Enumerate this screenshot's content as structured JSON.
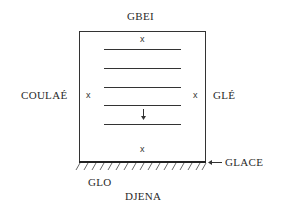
{
  "labels": {
    "top": "GBEI",
    "left": "COULAÉ",
    "right": "GLÉ",
    "ground_arrow": "GLACE",
    "bottom_left": "GLO",
    "bottom": "DJENA"
  },
  "markers": {
    "top": "x",
    "left": "x",
    "right": "x",
    "bottom": "x"
  },
  "diagram": {
    "box": {
      "left": 79,
      "top": 31,
      "right": 206,
      "bottom": 162
    },
    "stack_lines_y": [
      49,
      68,
      87,
      105,
      124
    ],
    "stack_lines_x": [
      104,
      181
    ],
    "arrow_direction": "down",
    "line_color": "#333333"
  }
}
